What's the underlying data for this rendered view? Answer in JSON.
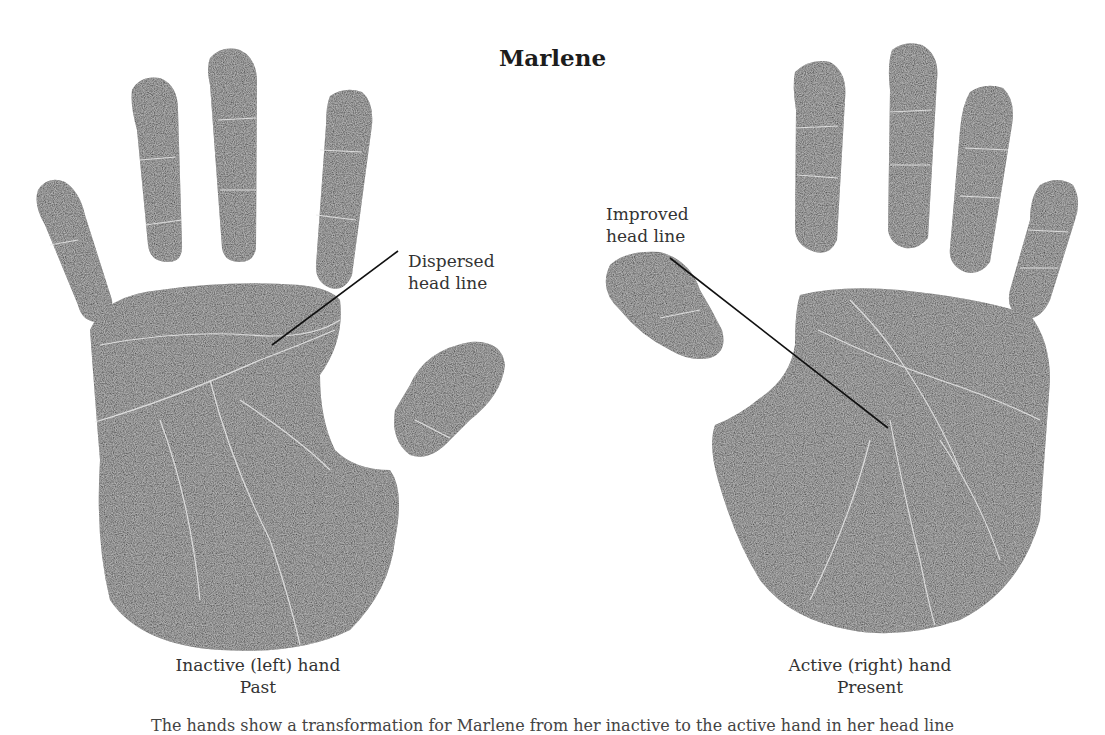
{
  "figure": {
    "title": "Marlene",
    "hands": [
      {
        "id": "left",
        "caption_line1": "Inactive (left) hand",
        "caption_line2": "Past",
        "annotation_line1": "Dispersed",
        "annotation_line2": "head line"
      },
      {
        "id": "right",
        "caption_line1": "Active (right) hand",
        "caption_line2": "Present",
        "annotation_line1": "Improved",
        "annotation_line2": "head line"
      }
    ],
    "bottom_caption": "The hands show a transformation for Marlene from her inactive to the active hand in her head line"
  },
  "colors": {
    "ink": "#2b2b2b",
    "ink_dark": "#1a1a1a",
    "crease": "#e8e8e8",
    "background": "#ffffff"
  }
}
